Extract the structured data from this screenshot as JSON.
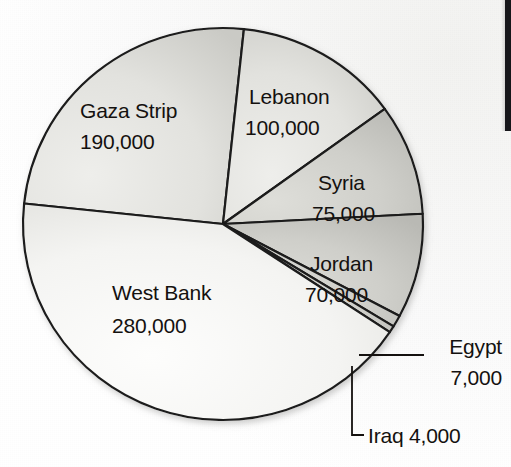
{
  "figure": {
    "background_color": "#fbfbfb",
    "pie": {
      "center_x": 223,
      "center_y": 224,
      "radius_x": 200,
      "radius_y": 196,
      "outline_color": "#1b1b1b",
      "outline_width": 2.2,
      "fill_light": "#f4f4f2",
      "fill_mid": "#dededa",
      "fill_dark": "#c2c2bd"
    }
  },
  "chart_data": {
    "type": "pie",
    "title": "",
    "xlabel": "",
    "ylabel": "",
    "total": 726000,
    "units": "people",
    "legend_position": "none",
    "grid": false,
    "categories": [
      "Gaza Strip",
      "Lebanon",
      "Syria",
      "Jordan",
      "Egypt",
      "Iraq",
      "West Bank"
    ],
    "values": [
      190000,
      100000,
      75000,
      70000,
      7000,
      4000,
      280000
    ],
    "labels": [
      "190,000",
      "100,000",
      "75,000",
      "70,000",
      "7,000",
      "4,000",
      "280,000"
    ],
    "slices": [
      {
        "name": "Gaza Strip",
        "value": 190000,
        "value_label": "190,000",
        "percent": 26.2,
        "start_angle": 186,
        "end_angle": 276,
        "label_x": 80,
        "label_y": 118,
        "value_x": 80,
        "value_y": 149,
        "label_anchor": "start",
        "shade": "mid",
        "callout": false
      },
      {
        "name": "Lebanon",
        "value": 100000,
        "value_label": "100,000",
        "percent": 13.8,
        "start_angle": 276,
        "end_angle": 324,
        "label_x": 249,
        "label_y": 104,
        "value_x": 245,
        "value_y": 135,
        "label_anchor": "start",
        "shade": "mid",
        "callout": false
      },
      {
        "name": "Syria",
        "value": 75000,
        "value_label": "75,000",
        "percent": 10.3,
        "start_angle": 324,
        "end_angle": 357,
        "label_x": 318,
        "label_y": 190,
        "value_x": 312,
        "value_y": 221,
        "label_anchor": "start",
        "shade": "dark",
        "callout": false
      },
      {
        "name": "Jordan",
        "value": 70000,
        "value_label": "70,000",
        "percent": 9.6,
        "start_angle": 357,
        "end_angle": 28,
        "label_x": 310,
        "label_y": 271,
        "value_x": 305,
        "value_y": 302,
        "label_anchor": "start",
        "shade": "dark",
        "callout": false
      },
      {
        "name": "Egypt",
        "value": 7000,
        "value_label": "7,000",
        "percent": 1.0,
        "start_angle": 28,
        "end_angle": 31.5,
        "label_x": 502,
        "label_y": 354,
        "value_x": 502,
        "value_y": 385,
        "label_anchor": "end",
        "shade": "dark",
        "callout": true,
        "leader": "M 359,355 L 424,355"
      },
      {
        "name": "Iraq",
        "value": 4000,
        "value_label": "4,000",
        "percent": 0.6,
        "start_angle": 31.5,
        "end_angle": 33.5,
        "label_x": 368,
        "label_y": 443,
        "value_x": 0,
        "value_y": 0,
        "label_anchor": "start",
        "shade": "dark",
        "callout": true,
        "leader": "M 352,366 L 352,435 L 364,435"
      },
      {
        "name": "West Bank",
        "value": 280000,
        "value_label": "280,000",
        "percent": 38.6,
        "start_angle": 33.5,
        "end_angle": 186,
        "label_x": 112,
        "label_y": 300,
        "value_x": 112,
        "value_y": 333,
        "label_anchor": "start",
        "shade": "light",
        "callout": false
      }
    ]
  },
  "callouts": {
    "egypt": {
      "name": "Egypt",
      "value_label": "7,000"
    },
    "iraq": {
      "combined_label": "Iraq 4,000"
    }
  }
}
